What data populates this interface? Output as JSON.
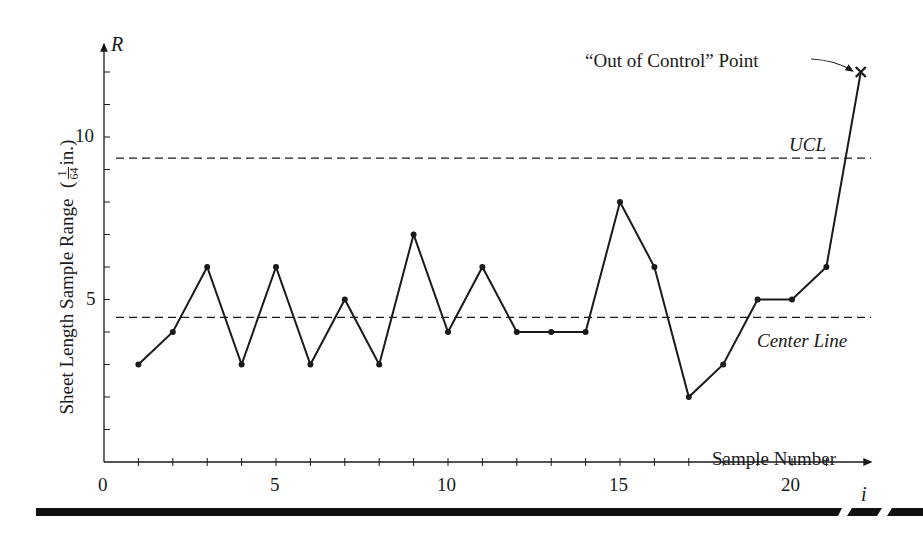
{
  "chart_data": {
    "type": "line",
    "title": "",
    "xlabel": "Sample Number",
    "xaxis_symbol": "i",
    "ylabel": "Sheet Length Sample Range",
    "ylabel_unit": {
      "open": "(",
      "num": "1",
      "den": "64",
      "suffix": "in.)"
    },
    "yaxis_symbol": "R",
    "x_ticks": [
      0,
      5,
      10,
      15,
      20
    ],
    "y_ticks": [
      5,
      10
    ],
    "xlim": [
      0,
      22.5
    ],
    "ylim": [
      0,
      12.5
    ],
    "grid": false,
    "series": [
      {
        "name": "Sample Range",
        "x": [
          1,
          2,
          3,
          4,
          5,
          6,
          7,
          8,
          9,
          10,
          11,
          12,
          13,
          14,
          15,
          16,
          17,
          18,
          19,
          20,
          21,
          22
        ],
        "values": [
          3,
          4,
          6,
          3,
          6,
          3,
          5,
          3,
          7,
          4,
          6,
          4,
          4,
          4,
          8,
          6,
          2,
          3,
          5,
          5,
          6,
          12
        ]
      }
    ],
    "reference_lines": [
      {
        "name": "UCL",
        "value": 9.35,
        "style": "dashed"
      },
      {
        "name": "Center Line",
        "value": 4.45,
        "style": "dashed"
      }
    ],
    "annotations": [
      {
        "text": "“Out of Control” Point",
        "target_x": 22,
        "target_y": 12,
        "marker": "x"
      }
    ]
  },
  "labels": {
    "y_symbol": "R",
    "x_symbol": "i",
    "x_axis_title": "Sample Number",
    "y_axis_title": "Sheet Length Sample Range",
    "y_unit_open": "(",
    "y_unit_num": "1",
    "y_unit_den": "64",
    "y_unit_suffix": "in.)",
    "ucl": "UCL",
    "center_line": "Center Line",
    "out_of_control": "“Out of Control” Point",
    "x_tick_0": "0",
    "x_tick_5": "5",
    "x_tick_10": "10",
    "x_tick_15": "15",
    "x_tick_20": "20",
    "y_tick_5": "5",
    "y_tick_10": "10"
  }
}
